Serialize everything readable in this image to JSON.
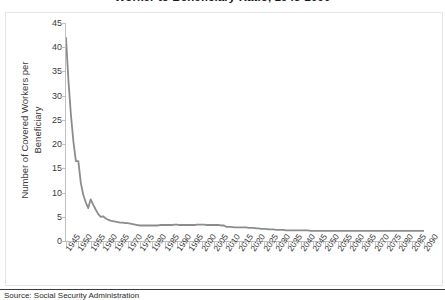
{
  "chart_data": {
    "type": "line",
    "title": "Worker to Beneficiary Ratio, 1945-2090",
    "xlabel": "",
    "ylabel_line1": "Number of Covered Workers per",
    "ylabel_line2": "Beneficiary",
    "ylim": [
      0,
      45
    ],
    "yticks": [
      0,
      5,
      10,
      15,
      20,
      25,
      30,
      35,
      40,
      45
    ],
    "xlim": [
      1945,
      2090
    ],
    "grid": false,
    "legend": "none",
    "line_color": "#8c8c8c",
    "categories": [
      "1945",
      "1950",
      "1955",
      "1960",
      "1965",
      "1970",
      "1975",
      "1980",
      "1985",
      "1990",
      "1995",
      "2000",
      "2005",
      "2010",
      "2015",
      "2020",
      "2025",
      "2030",
      "2035",
      "2040",
      "2045",
      "2050",
      "2055",
      "2060",
      "2065",
      "2070",
      "2075",
      "2080",
      "2085",
      "2090"
    ],
    "series": [
      {
        "name": "Worker to Beneficiary Ratio",
        "x": [
          1945,
          1946,
          1947,
          1948,
          1949,
          1950,
          1951,
          1952,
          1953,
          1954,
          1955,
          1956,
          1957,
          1958,
          1959,
          1960,
          1961,
          1962,
          1963,
          1964,
          1965,
          1966,
          1967,
          1968,
          1969,
          1970,
          1971,
          1972,
          1973,
          1974,
          1975,
          1976,
          1977,
          1978,
          1979,
          1980,
          1981,
          1982,
          1983,
          1984,
          1985,
          1986,
          1987,
          1988,
          1989,
          1990,
          1991,
          1992,
          1993,
          1994,
          1995,
          1996,
          1997,
          1998,
          1999,
          2000,
          2001,
          2002,
          2003,
          2004,
          2005,
          2006,
          2007,
          2008,
          2009,
          2010,
          2011,
          2012,
          2013,
          2014,
          2015,
          2016,
          2017,
          2018,
          2019,
          2020,
          2021,
          2022,
          2023,
          2024,
          2025,
          2026,
          2027,
          2028,
          2029,
          2030,
          2031,
          2032,
          2033,
          2034,
          2035,
          2036,
          2037,
          2038,
          2039,
          2040,
          2041,
          2042,
          2043,
          2044,
          2045,
          2046,
          2047,
          2048,
          2049,
          2050,
          2055,
          2060,
          2065,
          2070,
          2075,
          2080,
          2085,
          2090
        ],
        "values": [
          41.9,
          33.0,
          26.0,
          20.5,
          16.5,
          16.5,
          12.0,
          9.5,
          8.0,
          6.8,
          8.6,
          7.5,
          6.5,
          5.6,
          5.0,
          5.1,
          4.7,
          4.4,
          4.2,
          4.1,
          4.0,
          3.9,
          3.8,
          3.8,
          3.7,
          3.7,
          3.6,
          3.5,
          3.4,
          3.3,
          3.2,
          3.2,
          3.2,
          3.2,
          3.2,
          3.2,
          3.2,
          3.2,
          3.3,
          3.3,
          3.3,
          3.3,
          3.3,
          3.3,
          3.4,
          3.4,
          3.3,
          3.3,
          3.3,
          3.3,
          3.3,
          3.3,
          3.3,
          3.4,
          3.4,
          3.4,
          3.4,
          3.3,
          3.3,
          3.3,
          3.3,
          3.3,
          3.3,
          3.2,
          3.2,
          2.9,
          2.9,
          2.9,
          2.8,
          2.8,
          2.8,
          2.8,
          2.8,
          2.8,
          2.7,
          2.7,
          2.7,
          2.6,
          2.6,
          2.5,
          2.5,
          2.5,
          2.4,
          2.4,
          2.4,
          2.3,
          2.3,
          2.3,
          2.3,
          2.2,
          2.2,
          2.2,
          2.2,
          2.2,
          2.2,
          2.2,
          2.2,
          2.2,
          2.2,
          2.1,
          2.1,
          2.1,
          2.1,
          2.1,
          2.1,
          2.1,
          2.1,
          2.1,
          2.1,
          2.1,
          2.1,
          2.1,
          2.1,
          2.1
        ]
      }
    ]
  },
  "source": {
    "note": "Source: Social Security Administration"
  }
}
